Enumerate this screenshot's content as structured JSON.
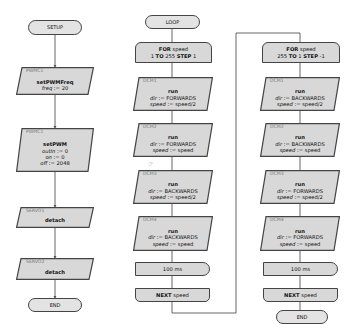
{
  "setup": {
    "start_label": "SETUP",
    "end_label": "END",
    "blocks": [
      {
        "device": "PWMC1",
        "method": "setPWMFreq",
        "args": [
          {
            "name": "freq",
            "value": "20"
          }
        ]
      },
      {
        "device": "PWMC1",
        "method": "setPWM",
        "args": [
          {
            "name": "outIn",
            "value": "0"
          },
          {
            "name": "on",
            "value": "0"
          },
          {
            "name": "off",
            "value": "2048"
          }
        ]
      },
      {
        "device": "SERVO1",
        "method": "detach",
        "args": []
      },
      {
        "device": "SERVO2",
        "method": "detach",
        "args": []
      }
    ]
  },
  "loop": {
    "start_label": "LOOP",
    "for1": {
      "kw_for": "FOR",
      "var": "speed",
      "from": "1",
      "kw_to": "TO",
      "to": "255",
      "kw_step": "STEP",
      "step": "1"
    },
    "for1_blocks": [
      {
        "device": "DCM1",
        "method": "run",
        "dir_name": "dir",
        "dir": "FORWARDS",
        "speed_name": "speed",
        "speed": "speed/2"
      },
      {
        "device": "DCM2",
        "method": "run",
        "dir_name": "dir",
        "dir": "FORWARDS",
        "speed_name": "speed",
        "speed": "speed"
      },
      {
        "device": "DCM3",
        "method": "run",
        "dir_name": "dir",
        "dir": "BACKWARDS",
        "speed_name": "speed",
        "speed": "speed/2"
      },
      {
        "device": "DCM4",
        "method": "run",
        "dir_name": "dir",
        "dir": "BACKWARDS",
        "speed_name": "speed",
        "speed": "speed"
      }
    ],
    "for1_delay": "100 ms",
    "for1_next": {
      "kw": "NEXT",
      "var": "speed"
    },
    "for2": {
      "kw_for": "FOR",
      "var": "speed",
      "from": "255",
      "kw_to": "TO",
      "to": "1",
      "kw_step": "STEP",
      "step": "-1"
    },
    "for2_blocks": [
      {
        "device": "DCM1",
        "method": "run",
        "dir_name": "dir",
        "dir": "BACKWARDS",
        "speed_name": "speed",
        "speed": "speed/2"
      },
      {
        "device": "DCM2",
        "method": "run",
        "dir_name": "dir",
        "dir": "BACKWARDS",
        "speed_name": "speed",
        "speed": "speed"
      },
      {
        "device": "DCM3",
        "method": "run",
        "dir_name": "dir",
        "dir": "FORWARDS",
        "speed_name": "speed",
        "speed": "speed/2"
      },
      {
        "device": "DCM4",
        "method": "run",
        "dir_name": "dir",
        "dir": "FORWARDS",
        "speed_name": "speed",
        "speed": "speed"
      }
    ],
    "for2_delay": "100 ms",
    "for2_next": {
      "kw": "NEXT",
      "var": "speed"
    },
    "end_label": "END"
  },
  "colors": {
    "block_fill": "#d8d8d8",
    "terminal_fill": "#e3e3e3",
    "stroke": "#444444",
    "wire": "#555555",
    "device_label": "#777777"
  }
}
